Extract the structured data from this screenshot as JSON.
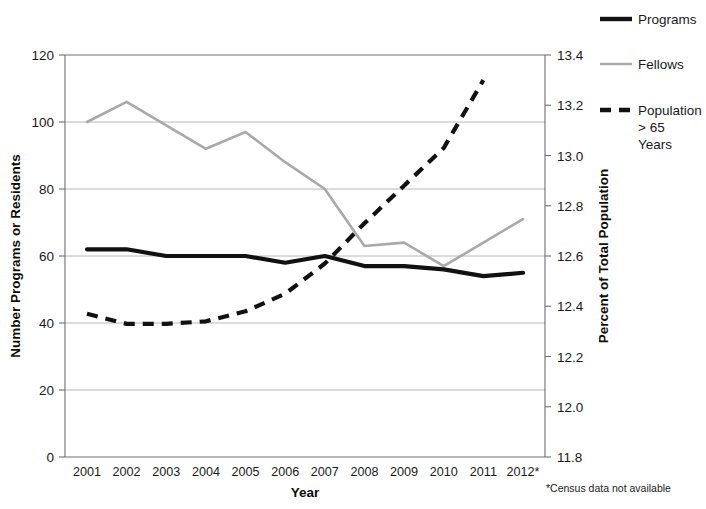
{
  "chart_data": {
    "type": "line",
    "title": "",
    "xlabel": "Year",
    "ylabel": "Number Programs or Residents",
    "y2label": "Percent of Total Population",
    "categories": [
      "2001",
      "2002",
      "2003",
      "2004",
      "2005",
      "2006",
      "2007",
      "2008",
      "2009",
      "2010",
      "2011",
      "2012*"
    ],
    "ylim": [
      0,
      120
    ],
    "yticks": [
      "0",
      "20",
      "40",
      "60",
      "80",
      "100",
      "120"
    ],
    "ytickvalues": [
      0,
      20,
      40,
      60,
      80,
      100,
      120
    ],
    "y2lim": [
      11.8,
      13.4
    ],
    "y2ticks": [
      "11.8",
      "12.0",
      "12.2",
      "12.4",
      "12.6",
      "12.8",
      "13.0",
      "13.2",
      "13.4"
    ],
    "y2tickvalues": [
      11.8,
      12.0,
      12.2,
      12.4,
      12.6,
      12.8,
      13.0,
      13.2,
      13.4
    ],
    "grid": true,
    "legend_position": "right",
    "series": [
      {
        "name": "Programs",
        "axis": "left",
        "style": "solid-thick-black",
        "color": "#111111",
        "values": [
          62,
          62,
          60,
          60,
          60,
          58,
          60,
          57,
          57,
          56,
          54,
          55
        ]
      },
      {
        "name": "Fellows",
        "axis": "left",
        "style": "solid-thin-gray",
        "color": "#a9a9a9",
        "values": [
          100,
          106,
          99,
          92,
          97,
          88,
          80,
          63,
          64,
          57,
          64,
          71
        ]
      },
      {
        "name": "Population > 65 Years",
        "axis": "right",
        "style": "dashed-thick-black",
        "color": "#111111",
        "values": [
          12.37,
          12.33,
          12.33,
          12.34,
          12.38,
          12.45,
          12.57,
          12.73,
          12.88,
          13.03,
          13.3,
          null
        ]
      }
    ],
    "annotations": [
      "*Census data not available"
    ]
  },
  "legend": {
    "items": [
      {
        "label": "Programs"
      },
      {
        "label": "Fellows"
      },
      {
        "label": "Population"
      },
      {
        "label": "> 65"
      },
      {
        "label": "Years"
      }
    ]
  },
  "footnote": "*Census data not available"
}
